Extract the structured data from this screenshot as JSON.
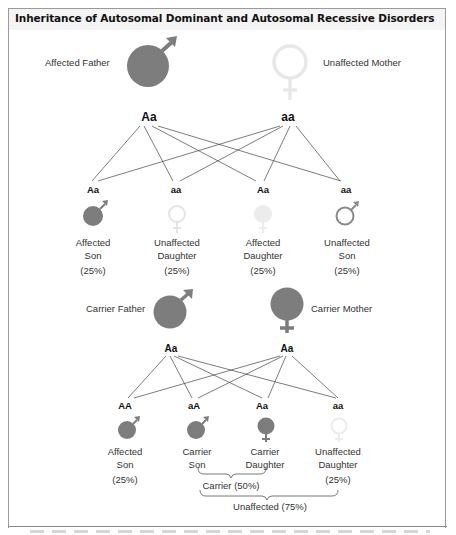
{
  "title": "Inheritance of Autosomal Dominant and Autosomal Recessive Disorders",
  "colors": {
    "affected_fill": "#7d7d7d",
    "unaffected_light": "#e6e6e6",
    "unaffected_outline_son": "#8a8a8a",
    "line": "#444444",
    "frame": "#9a9a9a"
  },
  "dominant": {
    "father": {
      "label": "Affected Father",
      "genotype": "Aa",
      "symbol": "male-filled-icon"
    },
    "mother": {
      "label": "Unaffected Mother",
      "genotype": "aa",
      "symbol": "female-outline-light-icon"
    },
    "children": [
      {
        "genotype": "Aa",
        "line1": "Affected",
        "line2": "Son",
        "pct": "(25%)",
        "symbol": "male-filled-icon"
      },
      {
        "genotype": "aa",
        "line1": "Unaffected",
        "line2": "Daughter",
        "pct": "(25%)",
        "symbol": "female-outline-light-icon"
      },
      {
        "genotype": "Aa",
        "line1": "Affected",
        "line2": "Daughter",
        "pct": "(25%)",
        "symbol": "female-filled-light-icon"
      },
      {
        "genotype": "aa",
        "line1": "Unaffected",
        "line2": "Son",
        "pct": "(25%)",
        "symbol": "male-outline-icon"
      }
    ]
  },
  "recessive": {
    "father": {
      "label": "Carrier Father",
      "genotype": "Aa",
      "symbol": "male-filled-icon"
    },
    "mother": {
      "label": "Carrier Mother",
      "genotype": "Aa",
      "symbol": "female-filled-icon"
    },
    "children": [
      {
        "genotype": "AA",
        "line1": "Affected",
        "line2": "Son",
        "pct": "(25%)",
        "symbol": "male-filled-icon"
      },
      {
        "genotype": "aA",
        "line1": "Carrier",
        "line2": "Son",
        "pct": "",
        "symbol": "male-filled-icon"
      },
      {
        "genotype": "Aa",
        "line1": "Carrier",
        "line2": "Daughter",
        "pct": "",
        "symbol": "female-filled-icon"
      },
      {
        "genotype": "aa",
        "line1": "Unaffected",
        "line2": "Daughter",
        "pct": "(25%)",
        "symbol": "female-outline-light-icon"
      }
    ],
    "brackets": {
      "carrier": "Carrier (50%)",
      "unaffected": "Unaffected (75%)"
    }
  }
}
